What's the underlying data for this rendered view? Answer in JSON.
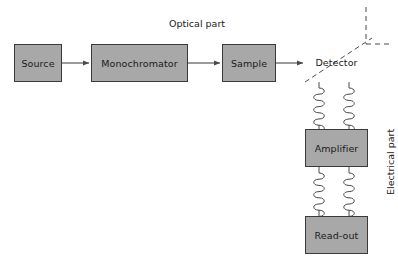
{
  "diagram": {
    "title_labels": [
      {
        "id": "optical-part",
        "text": "Optical part"
      },
      {
        "id": "electrical-part",
        "text": "Electrical part"
      }
    ],
    "nodes": [
      {
        "id": "source",
        "label": "Source",
        "x": 14,
        "y": 44,
        "w": 48,
        "h": 38
      },
      {
        "id": "monochromator",
        "label": "Monochromator",
        "x": 91,
        "y": 44,
        "w": 97,
        "h": 38
      },
      {
        "id": "sample",
        "label": "Sample",
        "x": 222,
        "y": 44,
        "w": 54,
        "h": 38
      },
      {
        "id": "detector",
        "label": "Detector",
        "x": 305,
        "y": 42,
        "w": 63,
        "h": 40
      },
      {
        "id": "amplifier",
        "label": "Amplifier",
        "x": 305,
        "y": 129,
        "w": 63,
        "h": 38
      },
      {
        "id": "readout",
        "label": "Read-out",
        "x": 305,
        "y": 216,
        "w": 63,
        "h": 38
      }
    ],
    "arrows": [
      {
        "id": "source-to-monochromator",
        "from": "source",
        "to": "monochromator"
      },
      {
        "id": "monochromator-to-sample",
        "from": "monochromator",
        "to": "sample"
      },
      {
        "id": "sample-to-detector",
        "from": "sample",
        "to": "detector"
      }
    ],
    "coil_links": [
      {
        "id": "detector-to-amplifier-left",
        "from": "detector",
        "to": "amplifier"
      },
      {
        "id": "detector-to-amplifier-right",
        "from": "detector",
        "to": "amplifier"
      },
      {
        "id": "amplifier-to-readout-left",
        "from": "amplifier",
        "to": "readout"
      },
      {
        "id": "amplifier-to-readout-right",
        "from": "amplifier",
        "to": "readout"
      }
    ],
    "dashed_marks": [
      {
        "id": "detector-diagonal",
        "kind": "diagonal-through-detector"
      },
      {
        "id": "boundary-vertical-dashed",
        "kind": "vertical"
      },
      {
        "id": "boundary-horizontal-dashed",
        "kind": "horizontal"
      }
    ],
    "colors": {
      "box_fill": "#a8a8a8",
      "box_stroke": "#3a3a3a",
      "line": "#4a4a4a",
      "text": "#1a1a1a",
      "background": "#ffffff"
    }
  }
}
